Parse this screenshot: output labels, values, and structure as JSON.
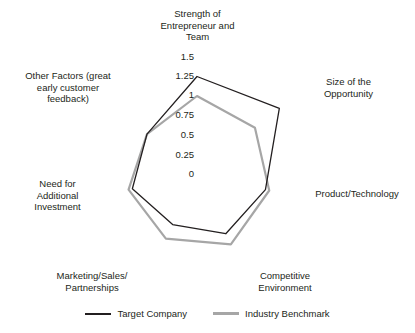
{
  "chart_data": {
    "type": "radar",
    "title": "",
    "subtitle": "",
    "xlabel": "",
    "ylabel": "",
    "grid": false,
    "legend_position": "bottom",
    "radial_axis": {
      "min": 0,
      "max": 1.5,
      "tick_step": 0.25,
      "tick_labels": [
        "1.5",
        "1.25",
        "1",
        "0.75",
        "0.5",
        "0.25",
        "0"
      ],
      "tick_values": [
        1.5,
        1.25,
        1,
        0.75,
        0.5,
        0.25,
        0
      ]
    },
    "categories": [
      "Strength of Entrepreneur and Team",
      "Size of the Opportunity",
      "Product/Technology",
      "Competitive Environment",
      "Marketing/Sales/ Partnerships",
      "Need for Additional Investment",
      "Other Factors (great early customer feedback)"
    ],
    "series": [
      {
        "name": "Target Company",
        "color": "#231f20",
        "values": [
          1.25,
          1.35,
          0.9,
          0.85,
          0.72,
          0.85,
          0.82
        ]
      },
      {
        "name": "Industry Benchmark",
        "color": "#a6a6a6",
        "values": [
          1.0,
          0.95,
          0.95,
          1.0,
          0.92,
          0.9,
          0.82
        ]
      }
    ]
  },
  "axis_labels": [
    {
      "id": "strength-of-entrepreneur-and-team",
      "text": "Strength of\nEntrepreneur and\nTeam"
    },
    {
      "id": "size-of-the-opportunity",
      "text": "Size of the\nOpportunity"
    },
    {
      "id": "product-technology",
      "text": "Product/Technology"
    },
    {
      "id": "competitive-environment",
      "text": "Competitive\nEnvironment"
    },
    {
      "id": "marketing-sales-partnerships",
      "text": "Marketing/Sales/\nPartnerships"
    },
    {
      "id": "need-for-additional-investment",
      "text": "Need for\nAdditional\nInvestment"
    },
    {
      "id": "other-factors",
      "text": "Other Factors (great\nearly customer\nfeedback)"
    }
  ],
  "ticks": [
    {
      "label": "1.5"
    },
    {
      "label": "1.25"
    },
    {
      "label": "1"
    },
    {
      "label": "0.75"
    },
    {
      "label": "0.5"
    },
    {
      "label": "0.25"
    },
    {
      "label": "0"
    }
  ],
  "legend": {
    "entries": [
      {
        "label": "Target Company",
        "color": "#231f20"
      },
      {
        "label": "Industry Benchmark",
        "color": "#a6a6a6"
      }
    ]
  },
  "colors": {
    "target_company": "#231f20",
    "industry_benchmark": "#a6a6a6",
    "background": "#ffffff",
    "text": "#231f20"
  }
}
